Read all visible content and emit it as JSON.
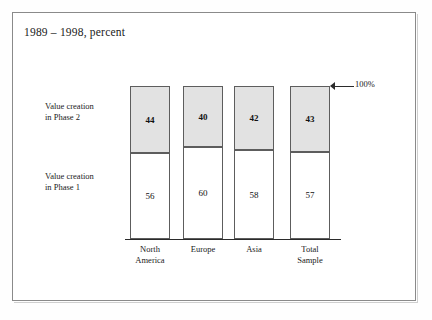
{
  "figure": {
    "title": "1989 – 1998, percent",
    "annotation_100": "100%",
    "series_labels": {
      "phase2": "Value creation\nin Phase 2",
      "phase1": "Value creation\nin Phase 1"
    }
  },
  "chart_data": {
    "type": "bar",
    "subtype": "stacked-100-percent",
    "title": "1989 – 1998, percent",
    "xlabel": "",
    "ylabel": "",
    "ylim": [
      0,
      100
    ],
    "grid": false,
    "legend_position": "left",
    "annotations": [
      "100%"
    ],
    "categories": [
      "North\nAmerica",
      "Europe",
      "Asia",
      "Total\nSample"
    ],
    "category_labels_flat": [
      "North America",
      "Europe",
      "Asia",
      "Total Sample"
    ],
    "series": [
      {
        "name": "Value creation in Phase 2",
        "values": [
          44,
          40,
          42,
          43
        ],
        "color": "#e2e2e2"
      },
      {
        "name": "Value creation in Phase 1",
        "values": [
          56,
          60,
          58,
          57
        ],
        "color": "#ffffff"
      }
    ]
  }
}
